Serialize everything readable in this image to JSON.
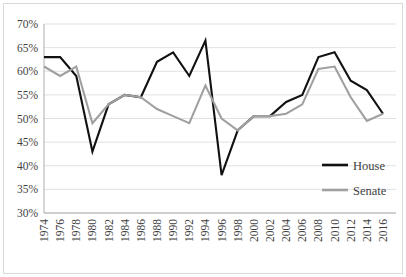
{
  "chart_data": {
    "type": "line",
    "title": "",
    "xlabel": "",
    "ylabel": "",
    "grid": true,
    "legend_position": "bottom-right",
    "ylim": [
      30,
      70
    ],
    "ytick_step": 5,
    "ytick_labels": [
      "70%",
      "65%",
      "60%",
      "55%",
      "50%",
      "45%",
      "40%",
      "35%",
      "30%"
    ],
    "ytick_values": [
      70,
      65,
      60,
      55,
      50,
      45,
      40,
      35,
      30
    ],
    "categories": [
      "1974",
      "1976",
      "1978",
      "1980",
      "1982",
      "1984",
      "1986",
      "1988",
      "1990",
      "1992",
      "1994",
      "1996",
      "1998",
      "2000",
      "2002",
      "2004",
      "2006",
      "2008",
      "2010",
      "2012",
      "2014",
      "2016"
    ],
    "x": [
      1974,
      1976,
      1978,
      1980,
      1982,
      1984,
      1986,
      1988,
      1990,
      1992,
      1994,
      1996,
      1998,
      2000,
      2002,
      2004,
      2006,
      2008,
      2010,
      2012,
      2014,
      2016
    ],
    "series": [
      {
        "name": "House",
        "color": "#111111",
        "values": [
          63,
          63,
          59,
          43,
          53,
          55,
          54.5,
          62,
          64,
          59,
          66.5,
          38,
          47.5,
          50.5,
          50.5,
          53.5,
          55,
          63,
          64,
          58,
          56,
          51
        ]
      },
      {
        "name": "Senate",
        "color": "#a0a0a0",
        "values": [
          61,
          59,
          61,
          49,
          53,
          55,
          54.5,
          52,
          50.5,
          49,
          57,
          50,
          47.5,
          50.5,
          50.5,
          51,
          53,
          60.5,
          61,
          54.5,
          49.5,
          51
        ]
      }
    ]
  },
  "legend": {
    "entries": [
      {
        "label": "House"
      },
      {
        "label": "Senate"
      }
    ]
  }
}
